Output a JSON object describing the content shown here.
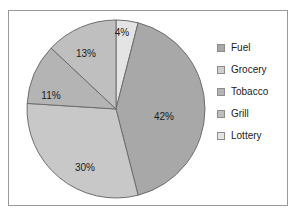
{
  "chart_data": {
    "type": "pie",
    "title": "",
    "labels": [
      "Fuel",
      "Grocery",
      "Tobacco",
      "Grill",
      "Lottery"
    ],
    "values": [
      42,
      30,
      11,
      13,
      4
    ],
    "value_labels": [
      "42%",
      "30%",
      "11%",
      "13%",
      "4%"
    ],
    "colors": [
      "#a8a8a8",
      "#c8c8c8",
      "#b4b4b4",
      "#bfbfbf",
      "#e4e4e4"
    ],
    "slice_order_clockwise_from_top": [
      "Lottery",
      "Fuel",
      "Grocery",
      "Tobacco",
      "Grill"
    ],
    "legend_position": "right",
    "grid": false,
    "border_color": "#9a9a9a",
    "slice_outline_color": "#6e6e6e",
    "label_color": "#1b1b1b"
  },
  "pie": {
    "center_x": 107,
    "center_y": 98,
    "radius": 89,
    "start_angle_deg": -90,
    "slices": [
      {
        "name": "Lottery",
        "value": 4,
        "label": "4%",
        "color": "#e4e4e4",
        "label_x": 113,
        "label_y": 22
      },
      {
        "name": "Fuel",
        "value": 42,
        "label": "42%",
        "color": "#a8a8a8",
        "label_x": 155,
        "label_y": 106
      },
      {
        "name": "Grocery",
        "value": 30,
        "label": "30%",
        "color": "#c8c8c8",
        "label_x": 76,
        "label_y": 157
      },
      {
        "name": "Tobacco",
        "value": 11,
        "label": "11%",
        "color": "#b4b4b4",
        "label_x": 42,
        "label_y": 85
      },
      {
        "name": "Grill",
        "value": 13,
        "label": "13%",
        "color": "#bfbfbf",
        "label_x": 77,
        "label_y": 43
      }
    ]
  },
  "legend": {
    "items": [
      {
        "label": "Fuel",
        "color": "#a8a8a8"
      },
      {
        "label": "Grocery",
        "color": "#cfcfcf"
      },
      {
        "label": "Tobacco",
        "color": "#b4b4b4"
      },
      {
        "label": "Grill",
        "color": "#bdbdbd"
      },
      {
        "label": "Lottery",
        "color": "#e4e4e4"
      }
    ]
  }
}
